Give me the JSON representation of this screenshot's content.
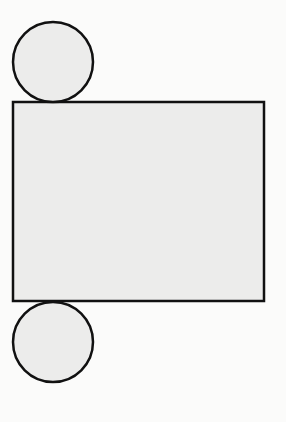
{
  "diagram": {
    "fill_color": "#ececeb",
    "stroke_color": "#111111",
    "background": "#fbfbfa",
    "shapes": {
      "top_circle": {
        "cx": 53,
        "cy": 62,
        "r": 40
      },
      "rectangle": {
        "x": 13,
        "y": 102,
        "width": 251,
        "height": 199
      },
      "bottom_circle": {
        "cx": 53,
        "cy": 342,
        "r": 40
      }
    }
  }
}
